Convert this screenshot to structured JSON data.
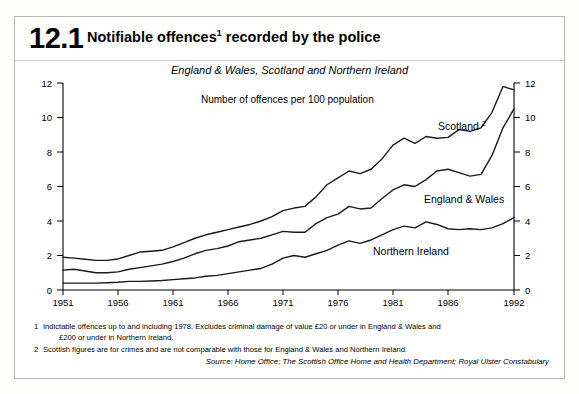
{
  "figure": {
    "number": "12.1",
    "title": "Notifiable offences",
    "title_footnote_marker": "1",
    "title_rest": " recorded by the police",
    "subtitle": "England & Wales, Scotland and Northern Ireland",
    "unit_note": "Number of offences per 100 population",
    "source": "Source: Home Office; The Scottish Office Home and Health Department; Royal Ulster Constabulary",
    "footnotes": [
      {
        "num": "1",
        "line1": "Indictable offences up to and including 1978. Excludes criminal damage of value £20 or under in England & Wales and",
        "line2": "£200 or under in Northern Ireland."
      },
      {
        "num": "2",
        "line1": "Scottish figures are for crimes and are not comparable with those for England & Wales and Northern Ireland.",
        "line2": ""
      }
    ]
  },
  "labels": {
    "scotland": "Scotland",
    "scotland_marker": "2",
    "england_wales": "England & Wales",
    "northern_ireland": "Northern Ireland"
  },
  "chart_data": {
    "type": "line",
    "subtitle": "England & Wales, Scotland and Northern Ireland",
    "xlabel": "",
    "ylabel": "Number of offences per 100 population",
    "xlim": [
      1951,
      1992
    ],
    "ylim": [
      0,
      12
    ],
    "yticks": [
      0,
      2,
      4,
      6,
      8,
      10,
      12
    ],
    "xticks": [
      1951,
      1956,
      1961,
      1966,
      1971,
      1976,
      1981,
      1986,
      1992
    ],
    "grid": false,
    "legend": "inline-labels",
    "axis_both_sides": true,
    "x": [
      1951,
      1952,
      1953,
      1954,
      1955,
      1956,
      1957,
      1958,
      1959,
      1960,
      1961,
      1962,
      1963,
      1964,
      1965,
      1966,
      1967,
      1968,
      1969,
      1970,
      1971,
      1972,
      1973,
      1974,
      1975,
      1976,
      1977,
      1978,
      1979,
      1980,
      1981,
      1982,
      1983,
      1984,
      1985,
      1986,
      1987,
      1988,
      1989,
      1990,
      1991,
      1992
    ],
    "series": [
      {
        "name": "Scotland",
        "footnote": "2",
        "values": [
          1.9,
          1.85,
          1.78,
          1.72,
          1.72,
          1.8,
          2.0,
          2.2,
          2.25,
          2.3,
          2.5,
          2.75,
          3.0,
          3.2,
          3.35,
          3.5,
          3.65,
          3.8,
          4.0,
          4.25,
          4.6,
          4.75,
          4.85,
          5.4,
          6.1,
          6.5,
          6.9,
          6.75,
          7.0,
          7.6,
          8.4,
          8.8,
          8.5,
          8.9,
          8.8,
          8.85,
          9.3,
          9.2,
          9.4,
          10.3,
          11.8,
          11.6
        ]
      },
      {
        "name": "England & Wales",
        "values": [
          1.15,
          1.2,
          1.1,
          1.0,
          1.0,
          1.05,
          1.2,
          1.3,
          1.4,
          1.5,
          1.65,
          1.85,
          2.1,
          2.3,
          2.4,
          2.55,
          2.8,
          2.9,
          3.0,
          3.2,
          3.4,
          3.35,
          3.35,
          3.85,
          4.2,
          4.4,
          4.85,
          4.7,
          4.75,
          5.3,
          5.8,
          6.1,
          6.0,
          6.4,
          6.9,
          7.0,
          6.8,
          6.6,
          6.7,
          7.8,
          9.4,
          10.5
        ]
      },
      {
        "name": "Northern Ireland",
        "values": [
          0.4,
          0.4,
          0.4,
          0.4,
          0.42,
          0.45,
          0.5,
          0.5,
          0.52,
          0.55,
          0.6,
          0.65,
          0.7,
          0.8,
          0.85,
          0.95,
          1.05,
          1.15,
          1.25,
          1.5,
          1.85,
          2.0,
          1.9,
          2.1,
          2.3,
          2.6,
          2.85,
          2.7,
          2.9,
          3.2,
          3.5,
          3.7,
          3.6,
          3.95,
          3.8,
          3.55,
          3.5,
          3.55,
          3.5,
          3.6,
          3.85,
          4.2
        ]
      }
    ]
  }
}
